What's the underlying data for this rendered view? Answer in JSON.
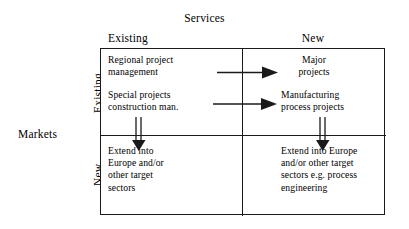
{
  "diagram": {
    "type": "2x2-matrix",
    "top_axis_title": "Services",
    "left_axis_title": "Markets",
    "column_headers": [
      "Existing",
      "New"
    ],
    "row_headers": [
      "Existing",
      "New"
    ],
    "quadrants": {
      "top_left": {
        "entries": [
          "Regional project\nmanagement",
          "Special projects\nconstruction man."
        ]
      },
      "top_right": {
        "entries": [
          "Major\nprojects",
          "Manufacturing\nprocess projects"
        ]
      },
      "bottom_left": {
        "entries": [
          "Extend into\nEurope and/or\nother target\nsectors"
        ]
      },
      "bottom_right": {
        "entries": [
          "Extend into Europe\nand/or other target\nsectors e.g. process\nengineering"
        ]
      }
    },
    "arrows": [
      {
        "name": "arrow-right-upper",
        "direction": "right",
        "style": "single"
      },
      {
        "name": "arrow-right-lower",
        "direction": "right",
        "style": "single"
      },
      {
        "name": "arrow-down-left",
        "direction": "down",
        "style": "double"
      },
      {
        "name": "arrow-down-right",
        "direction": "down",
        "style": "double"
      }
    ],
    "colors": {
      "line": "#1a1a1a",
      "text": "#000000",
      "background": "#ffffff"
    }
  }
}
